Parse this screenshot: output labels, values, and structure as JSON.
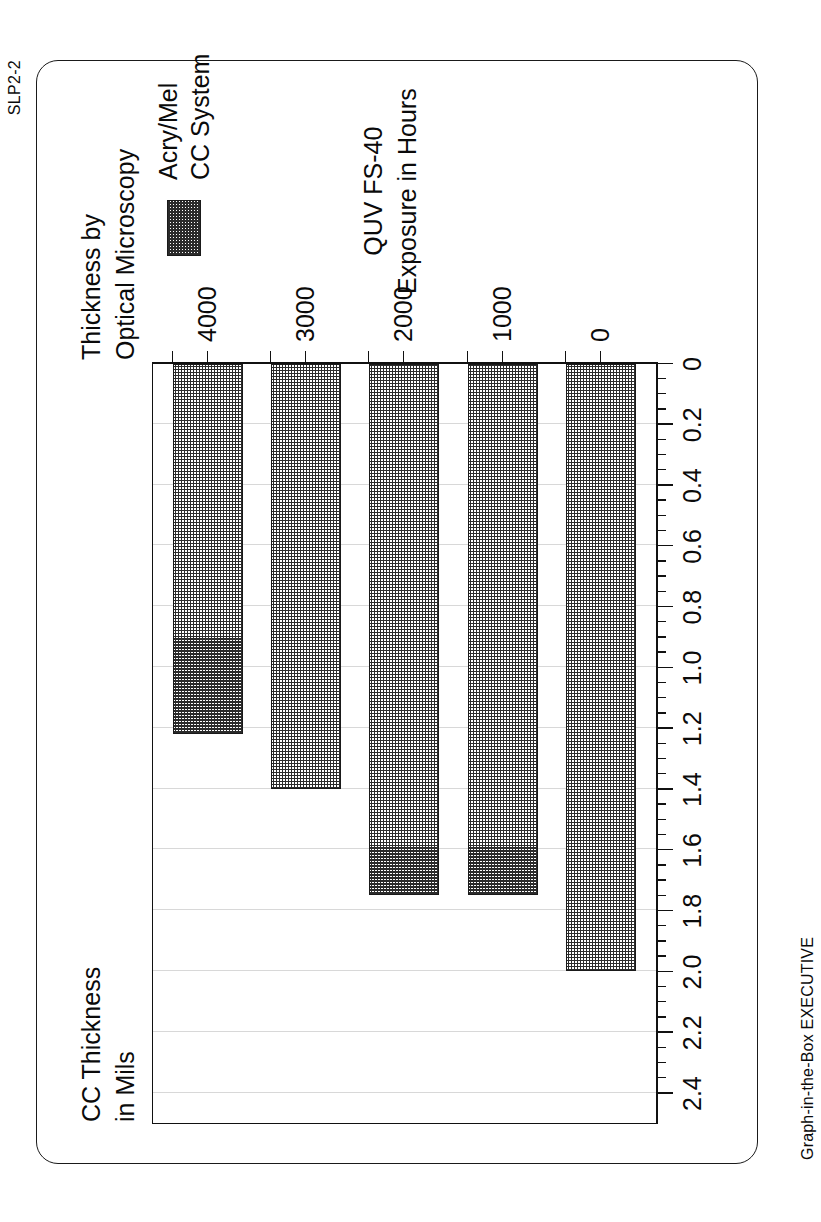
{
  "page": {
    "corner_code": "SLP2-2",
    "footer_code": "Graph-in-the-Box EXECUTIVE"
  },
  "legend": {
    "label_line1": "Acry/Mel",
    "label_line2": "CC System",
    "swatch_name": "crosshatch-pattern"
  },
  "colors": {
    "ink": "#1a1a1a",
    "grid": "#d8d8d8",
    "paper": "#ffffff",
    "bar_fill": "#2b2b2b"
  },
  "chart_data": {
    "type": "bar",
    "title": "Thickness by",
    "title_line2": "Optical Microscopy",
    "subtitle": "",
    "orientation": "horizontal",
    "categories": [
      "0",
      "1000",
      "2000",
      "3000",
      "4000"
    ],
    "values": [
      2.0,
      1.75,
      1.75,
      1.4,
      1.22
    ],
    "series": [
      {
        "name": "Acry/Mel CC System",
        "values": [
          2.0,
          1.75,
          1.75,
          1.4,
          1.22
        ]
      }
    ],
    "xlabel": "QUV FS-40",
    "xlabel_line2": "Exposure in Hours",
    "ylabel": "CC Thickness",
    "ylabel_line2": "in Mils",
    "ylim": [
      0,
      2.5
    ],
    "ytick_labels": [
      "2.4",
      "2.2",
      "2.0",
      "1.8",
      "1.6",
      "1.4",
      "1.2",
      "1.0",
      "0.8",
      "0.6",
      "0.4",
      "0.2",
      "0"
    ],
    "ytick_values": [
      2.4,
      2.2,
      2.0,
      1.8,
      1.6,
      1.4,
      1.2,
      1.0,
      0.8,
      0.6,
      0.4,
      0.2,
      0
    ],
    "minor_ticks_per_interval": 4,
    "grid": true,
    "grid_axis": "value",
    "legend_position": "top-right"
  }
}
